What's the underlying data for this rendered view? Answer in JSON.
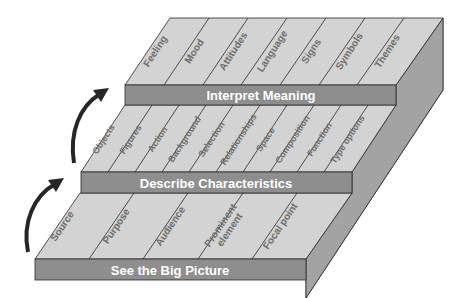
{
  "diagram": {
    "type": "stepped-pyramid",
    "tiers": [
      {
        "label": "See the Big Picture",
        "columns": [
          "Source",
          "Purpose",
          "Audience",
          "Prominent element",
          "Focal point"
        ]
      },
      {
        "label": "Describe Characteristics",
        "columns": [
          "Objects",
          "Figures",
          "Action",
          "Background",
          "Selection",
          "Relationships",
          "Space",
          "Composition",
          "Function",
          "Type options"
        ]
      },
      {
        "label": "Interpret Meaning",
        "columns": [
          "Feeling",
          "Mood",
          "Attitudes",
          "Language",
          "Signs",
          "Symbols",
          "Themes"
        ]
      }
    ],
    "arrows": [
      "up-arrow-1-to-2",
      "up-arrow-2-to-3"
    ],
    "colors": {
      "top_face": "#d3d3d3",
      "front_face": "#8e8e8e",
      "side_face": "#a3a3a3",
      "label_text": "#ffffff",
      "column_text": "#6e6e6e"
    }
  }
}
